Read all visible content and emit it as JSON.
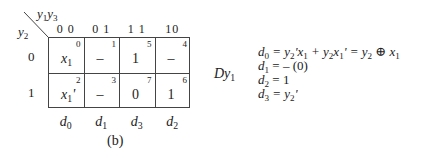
{
  "kmap": {
    "col_var": "y1y3",
    "row_var": "y2",
    "col_headers": [
      "0 0",
      "0 1",
      "1 1",
      "10"
    ],
    "row_headers": [
      "0",
      "1"
    ],
    "cells": [
      [
        {
          "num": "0",
          "val": "x1",
          "type": "x1"
        },
        {
          "num": "1",
          "val": "–",
          "type": "dash"
        },
        {
          "num": "5",
          "val": "1",
          "type": "plain"
        },
        {
          "num": "4",
          "val": "–",
          "type": "dash"
        }
      ],
      [
        {
          "num": "2",
          "val": "x1'",
          "type": "x1p"
        },
        {
          "num": "3",
          "val": "–",
          "type": "dash"
        },
        {
          "num": "7",
          "val": "0",
          "type": "plain"
        },
        {
          "num": "6",
          "val": "1",
          "type": "plain"
        }
      ]
    ],
    "col_outputs": [
      "d0",
      "d1",
      "d3",
      "d2"
    ],
    "caption": "(b)"
  },
  "label": "Dy1",
  "equations": [
    "d0 = y2'x1 + y2x1' = y2 ⊕ x1",
    "d1 = – (0)",
    "d2 = 1",
    "d3 = y2'"
  ]
}
